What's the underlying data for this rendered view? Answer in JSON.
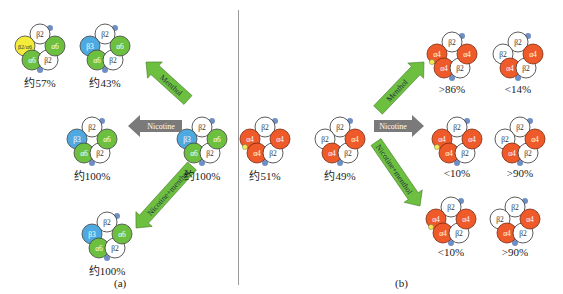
{
  "colors": {
    "alpha6": "#6cbf3f",
    "beta3": "#4da9e0",
    "beta2_alpha6": "#f4ec3a",
    "alpha4": "#ef5a2a",
    "beta2": "#ffffff",
    "binding_site": "#6f8fc4",
    "ligand": "#f1ea4a",
    "arrow_green": "#6cbf3f",
    "arrow_gray": "#7a7a7a",
    "divider": "#9a9a9a"
  },
  "panel_a": {
    "label": "(a)",
    "receptors": [
      {
        "id": "a-top-1",
        "subunits": [
          "β2",
          "β2/α6",
          "α6",
          "β2",
          "α6"
        ],
        "percent": "约57%"
      },
      {
        "id": "a-top-2",
        "subunits": [
          "β2",
          "β3",
          "α6",
          "β2",
          "α6"
        ],
        "percent": "约43%"
      },
      {
        "id": "a-mid-left",
        "subunits": [
          "β2",
          "β3",
          "α6",
          "β2",
          "α6"
        ],
        "percent": "约100%"
      },
      {
        "id": "a-mid-right",
        "subunits": [
          "β2",
          "β3",
          "α6",
          "β2",
          "α6"
        ],
        "percent": "约100%"
      },
      {
        "id": "a-bottom",
        "subunits": [
          "β2",
          "β3",
          "α6",
          "β2",
          "α6"
        ],
        "percent": "约100%"
      }
    ],
    "arrows": [
      {
        "label": "Menthol",
        "direction": "up-left"
      },
      {
        "label": "Nicotine",
        "direction": "left"
      },
      {
        "label": "Nicotine+menthol",
        "direction": "down-left"
      }
    ]
  },
  "panel_b": {
    "label": "(b)",
    "receptors": [
      {
        "id": "b-left-1",
        "subunits": [
          "β2",
          "α4",
          "α4",
          "β2",
          "α4"
        ],
        "percent": "约51%"
      },
      {
        "id": "b-left-2",
        "subunits": [
          "β2",
          "β2",
          "α4",
          "β2",
          "α4"
        ],
        "percent": "约49%"
      },
      {
        "id": "b-top-1",
        "subunits": [
          "β2",
          "α4",
          "α4",
          "β2",
          "α4"
        ],
        "percent": ">86%"
      },
      {
        "id": "b-top-2",
        "subunits": [
          "β2",
          "β2",
          "α4",
          "β2",
          "α4"
        ],
        "percent": "<14%"
      },
      {
        "id": "b-mid-1",
        "subunits": [
          "β2",
          "α4",
          "α4",
          "β2",
          "α4"
        ],
        "percent": "<10%"
      },
      {
        "id": "b-mid-2",
        "subunits": [
          "β2",
          "β2",
          "α4",
          "β2",
          "α4"
        ],
        "percent": ">90%"
      },
      {
        "id": "b-bot-1",
        "subunits": [
          "β2",
          "α4",
          "α4",
          "β2",
          "α4"
        ],
        "percent": "<10%"
      },
      {
        "id": "b-bot-2",
        "subunits": [
          "β2",
          "β2",
          "α4",
          "β2",
          "α4"
        ],
        "percent": ">90%"
      }
    ],
    "arrows": [
      {
        "label": "Menthol",
        "direction": "up-right"
      },
      {
        "label": "Nicotine",
        "direction": "right"
      },
      {
        "label": "Nicotine+menthol",
        "direction": "down-right"
      }
    ]
  }
}
